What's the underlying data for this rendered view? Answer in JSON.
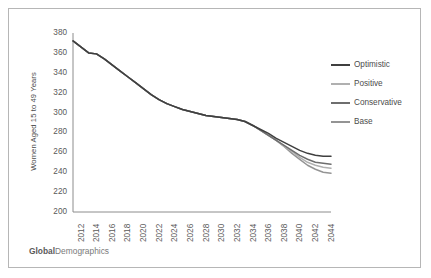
{
  "footer": {
    "brand_bold": "Global",
    "brand_rest": "Demographics"
  },
  "legend": {
    "items": [
      {
        "label": "Optimistic",
        "color": "#3f3f3f"
      },
      {
        "label": "Positive",
        "color": "#b0b0b0"
      },
      {
        "label": "Conservative",
        "color": "#6e6e6e"
      },
      {
        "label": "Base",
        "color": "#949494"
      }
    ]
  },
  "chart_data": {
    "type": "line",
    "title": "",
    "xlabel": "",
    "ylabel": "Women Aged 15 to 49 Years",
    "ylim": [
      200,
      380
    ],
    "ytick_step": 20,
    "yticks": [
      380,
      360,
      340,
      320,
      300,
      280,
      260,
      240,
      220,
      200
    ],
    "xlim": [
      2012,
      2045
    ],
    "xticks": [
      2012,
      2014,
      2016,
      2018,
      2020,
      2022,
      2024,
      2026,
      2028,
      2030,
      2032,
      2034,
      2036,
      2038,
      2040,
      2042,
      2044
    ],
    "grid": false,
    "legend_position": "right",
    "x": [
      2012,
      2013,
      2014,
      2015,
      2016,
      2017,
      2018,
      2019,
      2020,
      2021,
      2022,
      2023,
      2024,
      2025,
      2026,
      2027,
      2028,
      2029,
      2030,
      2031,
      2032,
      2033,
      2034,
      2035,
      2036,
      2037,
      2038,
      2039,
      2040,
      2041,
      2042,
      2043,
      2044,
      2045
    ],
    "series": [
      {
        "name": "Base",
        "color": "#949494",
        "values": [
          372,
          366,
          360,
          359,
          354,
          348,
          342,
          336,
          330,
          324,
          318,
          313,
          309,
          306,
          303,
          301,
          299,
          297,
          296,
          295,
          294,
          293,
          291,
          287,
          282,
          277,
          272,
          266,
          259,
          253,
          247,
          243,
          240,
          239
        ]
      },
      {
        "name": "Conservative",
        "color": "#6e6e6e",
        "values": [
          372,
          366,
          360,
          359,
          354,
          348,
          342,
          336,
          330,
          324,
          318,
          313,
          309,
          306,
          303,
          301,
          299,
          297,
          296,
          295,
          294,
          293,
          291,
          287,
          282,
          277,
          272,
          267,
          262,
          257,
          253,
          250,
          249,
          248
        ]
      },
      {
        "name": "Positive",
        "color": "#b0b0b0",
        "values": [
          372,
          366,
          360,
          359,
          354,
          348,
          342,
          336,
          330,
          324,
          318,
          313,
          309,
          306,
          303,
          301,
          299,
          297,
          296,
          295,
          294,
          293,
          291,
          287,
          282,
          277,
          272,
          266,
          261,
          255,
          250,
          247,
          245,
          244
        ]
      },
      {
        "name": "Optimistic",
        "color": "#3f3f3f",
        "values": [
          372,
          366,
          360,
          359,
          354,
          348,
          342,
          336,
          330,
          324,
          318,
          313,
          309,
          306,
          303,
          301,
          299,
          297,
          296,
          295,
          294,
          293,
          291,
          287,
          283,
          279,
          274,
          270,
          266,
          262,
          259,
          257,
          256,
          256
        ]
      }
    ]
  }
}
